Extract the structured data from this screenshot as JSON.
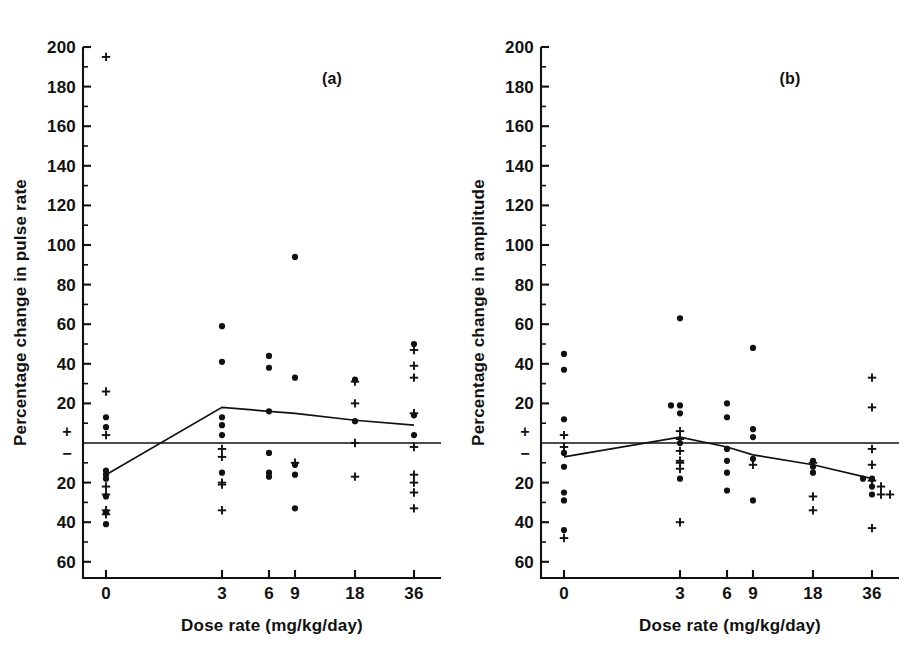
{
  "figure": {
    "background": "#ffffff",
    "ink_color": "#111111",
    "marker_dot_name": "filled-circle",
    "marker_plus_name": "plus-sign"
  },
  "chart_data": [
    {
      "type": "scatter",
      "panel_label": "(a)",
      "title": "",
      "xlabel": "Dose rate (mg/kg/day)",
      "ylabel": "Percentage change in pulse rate",
      "categories": [
        "0",
        "3",
        "6",
        "9",
        "18",
        "36"
      ],
      "x_tick_labels": [
        "0",
        "3",
        "6",
        "9",
        "18",
        "36"
      ],
      "y_tick_labels": [
        "200",
        "180",
        "160",
        "140",
        "120",
        "100",
        "80",
        "60",
        "40",
        "20",
        "+",
        "−",
        "20",
        "40",
        "60"
      ],
      "y_tick_values": [
        200,
        180,
        160,
        140,
        120,
        100,
        80,
        60,
        40,
        20,
        0,
        0,
        -20,
        -40,
        -60
      ],
      "ylim": [
        -70,
        200
      ],
      "zero_marker_positive": "+",
      "zero_marker_negative": "−",
      "grid": false,
      "legend": "none",
      "zero_reference_line": 0,
      "trend_line": {
        "name": "median-trend",
        "x": [
          "0",
          "3",
          "6",
          "9",
          "18",
          "36"
        ],
        "y": [
          -16,
          18,
          16,
          15,
          11.5,
          9
        ]
      },
      "series": [
        {
          "name": "dot",
          "marker": "filled-circle",
          "points": [
            {
              "x": "0",
              "y": 8
            },
            {
              "x": "0",
              "y": 13
            },
            {
              "x": "0",
              "y": -14
            },
            {
              "x": "0",
              "y": -16
            },
            {
              "x": "0",
              "y": -18
            },
            {
              "x": "0",
              "y": -27
            },
            {
              "x": "0",
              "y": -35
            },
            {
              "x": "0",
              "y": -41
            },
            {
              "x": "3",
              "y": 59
            },
            {
              "x": "3",
              "y": 41
            },
            {
              "x": "3",
              "y": 13
            },
            {
              "x": "3",
              "y": 9
            },
            {
              "x": "3",
              "y": 4
            },
            {
              "x": "3",
              "y": -15
            },
            {
              "x": "6",
              "y": 44
            },
            {
              "x": "6",
              "y": 38
            },
            {
              "x": "6",
              "y": 16
            },
            {
              "x": "6",
              "y": -5
            },
            {
              "x": "6",
              "y": -15
            },
            {
              "x": "6",
              "y": -17
            },
            {
              "x": "9",
              "y": 94
            },
            {
              "x": "9",
              "y": 33
            },
            {
              "x": "9",
              "y": -11
            },
            {
              "x": "9",
              "y": -16
            },
            {
              "x": "9",
              "y": -33
            },
            {
              "x": "18",
              "y": 32
            },
            {
              "x": "18",
              "y": 11
            },
            {
              "x": "36",
              "y": 50
            },
            {
              "x": "36",
              "y": 14
            },
            {
              "x": "36",
              "y": 4
            }
          ]
        },
        {
          "name": "plus",
          "marker": "plus-sign",
          "points": [
            {
              "x": "0",
              "y": 195
            },
            {
              "x": "0",
              "y": 26
            },
            {
              "x": "0",
              "y": 4
            },
            {
              "x": "0",
              "y": -22
            },
            {
              "x": "0",
              "y": -26
            },
            {
              "x": "0",
              "y": -34
            },
            {
              "x": "0",
              "y": -36
            },
            {
              "x": "3",
              "y": -3
            },
            {
              "x": "3",
              "y": -7
            },
            {
              "x": "3",
              "y": -20
            },
            {
              "x": "3",
              "y": -21
            },
            {
              "x": "3",
              "y": -34
            },
            {
              "x": "9",
              "y": -10
            },
            {
              "x": "18",
              "y": 31
            },
            {
              "x": "18",
              "y": 20
            },
            {
              "x": "18",
              "y": 0
            },
            {
              "x": "18",
              "y": -17
            },
            {
              "x": "36",
              "y": 47
            },
            {
              "x": "36",
              "y": 39
            },
            {
              "x": "36",
              "y": 33
            },
            {
              "x": "36",
              "y": 15
            },
            {
              "x": "36",
              "y": -2
            },
            {
              "x": "36",
              "y": -16
            },
            {
              "x": "36",
              "y": -20
            },
            {
              "x": "36",
              "y": -25
            },
            {
              "x": "36",
              "y": -33
            }
          ]
        }
      ]
    },
    {
      "type": "scatter",
      "panel_label": "(b)",
      "title": "",
      "xlabel": "Dose rate (mg/kg/day)",
      "ylabel": "Percentage change in amplitude",
      "categories": [
        "0",
        "3",
        "6",
        "9",
        "18",
        "36"
      ],
      "x_tick_labels": [
        "0",
        "3",
        "6",
        "9",
        "18",
        "36"
      ],
      "y_tick_labels": [
        "200",
        "180",
        "160",
        "140",
        "120",
        "100",
        "80",
        "60",
        "40",
        "20",
        "+",
        "−",
        "20",
        "40",
        "60"
      ],
      "y_tick_values": [
        200,
        180,
        160,
        140,
        120,
        100,
        80,
        60,
        40,
        20,
        0,
        0,
        -20,
        -40,
        -60
      ],
      "ylim": [
        -70,
        200
      ],
      "zero_marker_positive": "+",
      "zero_marker_negative": "−",
      "grid": false,
      "legend": "none",
      "zero_reference_line": 0,
      "trend_line": {
        "name": "median-trend",
        "x": [
          "0",
          "3",
          "6",
          "9",
          "18",
          "36"
        ],
        "y": [
          -7,
          3,
          -2,
          -6,
          -11,
          -18
        ]
      },
      "series": [
        {
          "name": "dot",
          "marker": "filled-circle",
          "points": [
            {
              "x": "0",
              "y": 45
            },
            {
              "x": "0",
              "y": 37
            },
            {
              "x": "0",
              "y": 12
            },
            {
              "x": "0",
              "y": -5
            },
            {
              "x": "0",
              "y": -12
            },
            {
              "x": "0",
              "y": -25
            },
            {
              "x": "0",
              "y": -29
            },
            {
              "x": "0",
              "y": -44
            },
            {
              "x": "3",
              "y": 63
            },
            {
              "x": "3",
              "y": 19
            },
            {
              "x": "3",
              "y": 19
            },
            {
              "x": "3",
              "y": 15
            },
            {
              "x": "3",
              "y": 0
            },
            {
              "x": "3",
              "y": -18
            },
            {
              "x": "6",
              "y": 20
            },
            {
              "x": "6",
              "y": 13
            },
            {
              "x": "6",
              "y": -3
            },
            {
              "x": "6",
              "y": -9
            },
            {
              "x": "6",
              "y": -15
            },
            {
              "x": "6",
              "y": -24
            },
            {
              "x": "9",
              "y": 48
            },
            {
              "x": "9",
              "y": 7
            },
            {
              "x": "9",
              "y": 3
            },
            {
              "x": "9",
              "y": -8
            },
            {
              "x": "9",
              "y": -29
            },
            {
              "x": "18",
              "y": -9
            },
            {
              "x": "18",
              "y": -12
            },
            {
              "x": "18",
              "y": -15
            },
            {
              "x": "36",
              "y": -18
            },
            {
              "x": "36",
              "y": -18
            },
            {
              "x": "36",
              "y": -22
            },
            {
              "x": "36",
              "y": -26
            }
          ]
        },
        {
          "name": "plus",
          "marker": "plus-sign",
          "points": [
            {
              "x": "0",
              "y": 4
            },
            {
              "x": "0",
              "y": -2
            },
            {
              "x": "0",
              "y": -48
            },
            {
              "x": "3",
              "y": 6
            },
            {
              "x": "3",
              "y": 2
            },
            {
              "x": "3",
              "y": -4
            },
            {
              "x": "3",
              "y": -9
            },
            {
              "x": "3",
              "y": -10
            },
            {
              "x": "3",
              "y": -13
            },
            {
              "x": "3",
              "y": -40
            },
            {
              "x": "9",
              "y": -11
            },
            {
              "x": "18",
              "y": -10
            },
            {
              "x": "18",
              "y": -27
            },
            {
              "x": "18",
              "y": -34
            },
            {
              "x": "36",
              "y": 33
            },
            {
              "x": "36",
              "y": 18
            },
            {
              "x": "36",
              "y": -3
            },
            {
              "x": "36",
              "y": -11
            },
            {
              "x": "36",
              "y": -19
            },
            {
              "x": "36",
              "y": -22
            },
            {
              "x": "36",
              "y": -26
            },
            {
              "x": "36",
              "y": -26
            },
            {
              "x": "36",
              "y": -43
            }
          ]
        }
      ]
    }
  ]
}
